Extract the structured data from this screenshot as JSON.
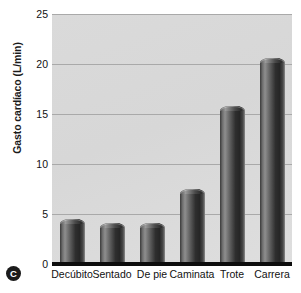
{
  "panel": {
    "badge_label": "C"
  },
  "chart_data": {
    "type": "bar",
    "title": "",
    "subtitle": "",
    "xlabel": "",
    "ylabel": "Gasto cardíaco (L/min)",
    "categories": [
      "Decúbito",
      "Sentado",
      "De pie",
      "Caminata",
      "Trote",
      "Carrera"
    ],
    "values": [
      4.5,
      4.1,
      4.1,
      7.5,
      15.8,
      20.6
    ],
    "ylim": [
      0,
      25
    ],
    "ytick_labels": [
      "0",
      "5",
      "10",
      "15",
      "20",
      "25"
    ],
    "ytick_values": [
      0,
      5,
      10,
      15,
      20,
      25
    ],
    "grid": true,
    "legend": "none",
    "legend_position": "none",
    "series": [
      {
        "name": "Gasto cardíaco",
        "values": [
          4.5,
          4.1,
          4.1,
          7.5,
          15.8,
          20.6
        ]
      }
    ],
    "colors": {
      "plot_background": "#d9d9d9",
      "bar_fill": "#3a3a3a",
      "gridline": "#a9a9a9",
      "axis": "#0d0d0d",
      "text": "#111111",
      "badge": "#1b1b1b"
    }
  }
}
